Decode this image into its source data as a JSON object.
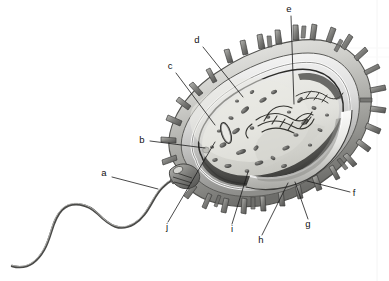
{
  "figure": {
    "alt": "Grayscale anatomical illustration of a rod-shaped bacterium with flagellum and pili, cut away to show internal structures",
    "background_color": "#ffffff",
    "ink_color": "#1a1a1a",
    "width": 389,
    "height": 281
  },
  "labels": [
    {
      "key": "a",
      "text": "a",
      "x": 104,
      "y": 176,
      "line": [
        [
          112,
          177
        ],
        [
          158,
          189
        ]
      ]
    },
    {
      "key": "b",
      "text": "b",
      "x": 142,
      "y": 143,
      "line": [
        [
          150,
          141
        ],
        [
          205,
          148
        ]
      ]
    },
    {
      "key": "c",
      "text": "c",
      "x": 170,
      "y": 69,
      "line": [
        [
          176,
          73
        ],
        [
          215,
          125
        ]
      ]
    },
    {
      "key": "d",
      "text": "d",
      "x": 197,
      "y": 43,
      "line": [
        [
          203,
          47
        ],
        [
          243,
          97
        ]
      ]
    },
    {
      "key": "e",
      "text": "e",
      "x": 288,
      "y": 12,
      "line": [
        [
          291,
          16
        ],
        [
          294,
          104
        ]
      ]
    },
    {
      "key": "f",
      "text": "f",
      "x": 352,
      "y": 196,
      "line": [
        [
          350,
          192
        ],
        [
          307,
          181
        ]
      ]
    },
    {
      "key": "g",
      "text": "g",
      "x": 306,
      "y": 226,
      "line": [
        [
          308,
          219
        ],
        [
          295,
          182
        ]
      ]
    },
    {
      "key": "h",
      "text": "h",
      "x": 259,
      "y": 242,
      "line": [
        [
          262,
          235
        ],
        [
          288,
          183
        ]
      ]
    },
    {
      "key": "i",
      "text": "i",
      "x": 231,
      "y": 231,
      "line": [
        [
          232,
          224
        ],
        [
          248,
          172
        ]
      ]
    },
    {
      "key": "j",
      "text": "j",
      "x": 165,
      "y": 229,
      "line": [
        [
          168,
          222
        ],
        [
          215,
          142
        ]
      ]
    }
  ],
  "structures": {
    "flagellum": "flagellum",
    "basal_body": "basal-body",
    "cell_wall": "cell-wall",
    "plasma_membrane": "plasma-membrane",
    "cytoplasm": "cytoplasm",
    "nucleoid": "nucleoid",
    "ribosomes": "ribosomes",
    "plasmid": "plasmid",
    "capsule": "capsule",
    "pili": "pili"
  }
}
